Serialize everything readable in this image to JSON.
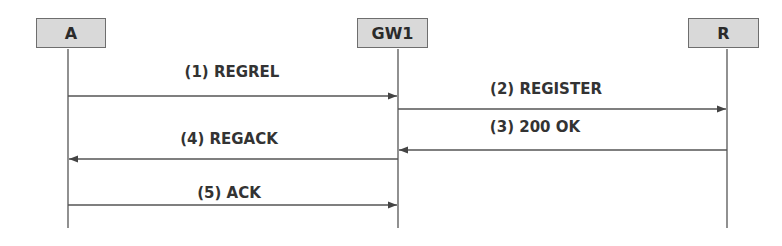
{
  "diagram": {
    "type": "sequence",
    "entities": [
      {
        "id": "A",
        "label": "A"
      },
      {
        "id": "GW1",
        "label": "GW1"
      },
      {
        "id": "R",
        "label": "R"
      }
    ],
    "messages": [
      {
        "label": "(1) REGREL",
        "from": "A",
        "to": "GW1"
      },
      {
        "label": "(2) REGISTER",
        "from": "GW1",
        "to": "R"
      },
      {
        "label": "(3) 200 OK",
        "from": "R",
        "to": "GW1"
      },
      {
        "label": "(4) REGACK",
        "from": "GW1",
        "to": "A"
      },
      {
        "label": "(5) ACK",
        "from": "A",
        "to": "GW1"
      }
    ],
    "colors": {
      "box_fill": "#d9d9d9",
      "line": "#555555",
      "text": "#333333"
    }
  }
}
